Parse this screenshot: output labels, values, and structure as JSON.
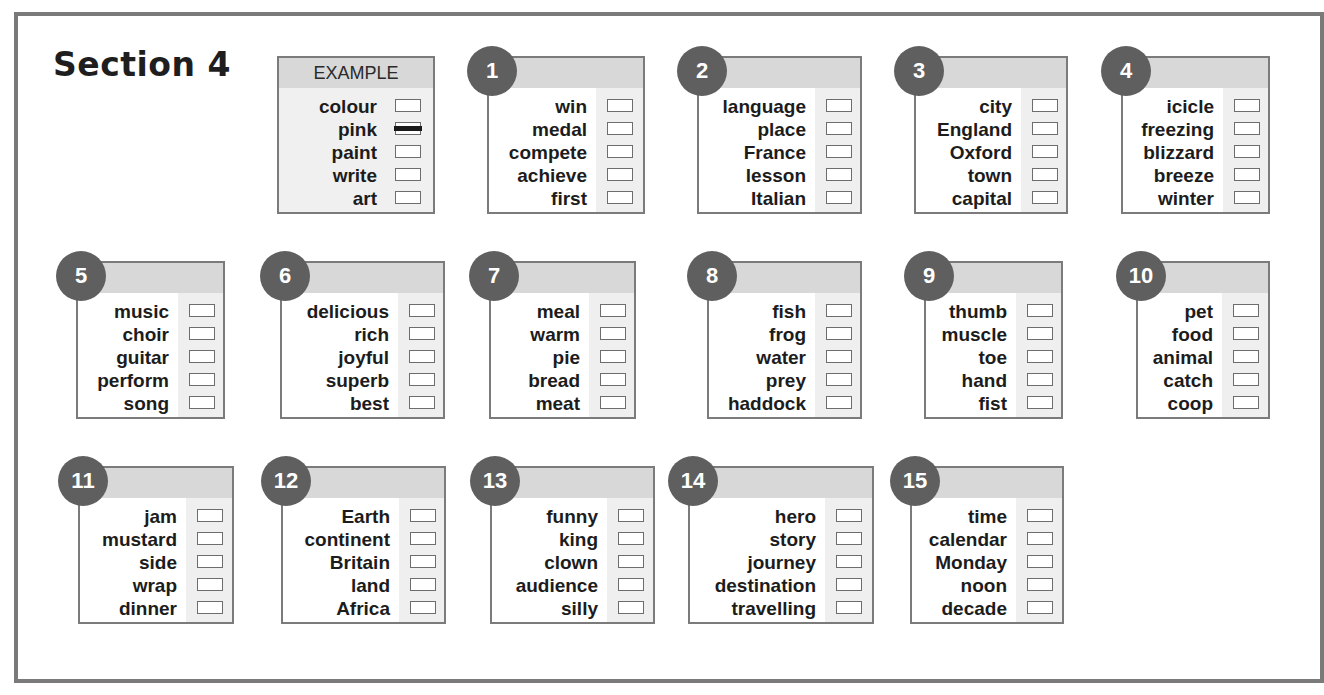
{
  "title": "Section 4",
  "colors": {
    "frame": "#7a7a7a",
    "badge": "#5f5f5f",
    "header": "#d8d8d8",
    "strip": "#efefef"
  },
  "example": {
    "label": "EXAMPLE",
    "words": [
      "colour",
      "pink",
      "paint",
      "write",
      "art"
    ],
    "marked_index": 1
  },
  "questions": [
    {
      "number": "1",
      "words": [
        "win",
        "medal",
        "compete",
        "achieve",
        "first"
      ]
    },
    {
      "number": "2",
      "words": [
        "language",
        "place",
        "France",
        "lesson",
        "Italian"
      ]
    },
    {
      "number": "3",
      "words": [
        "city",
        "England",
        "Oxford",
        "town",
        "capital"
      ]
    },
    {
      "number": "4",
      "words": [
        "icicle",
        "freezing",
        "blizzard",
        "breeze",
        "winter"
      ]
    },
    {
      "number": "5",
      "words": [
        "music",
        "choir",
        "guitar",
        "perform",
        "song"
      ]
    },
    {
      "number": "6",
      "words": [
        "delicious",
        "rich",
        "joyful",
        "superb",
        "best"
      ]
    },
    {
      "number": "7",
      "words": [
        "meal",
        "warm",
        "pie",
        "bread",
        "meat"
      ]
    },
    {
      "number": "8",
      "words": [
        "fish",
        "frog",
        "water",
        "prey",
        "haddock"
      ]
    },
    {
      "number": "9",
      "words": [
        "thumb",
        "muscle",
        "toe",
        "hand",
        "fist"
      ]
    },
    {
      "number": "10",
      "words": [
        "pet",
        "food",
        "animal",
        "catch",
        "coop"
      ]
    },
    {
      "number": "11",
      "words": [
        "jam",
        "mustard",
        "side",
        "wrap",
        "dinner"
      ]
    },
    {
      "number": "12",
      "words": [
        "Earth",
        "continent",
        "Britain",
        "land",
        "Africa"
      ]
    },
    {
      "number": "13",
      "words": [
        "funny",
        "king",
        "clown",
        "audience",
        "silly"
      ]
    },
    {
      "number": "14",
      "words": [
        "hero",
        "story",
        "journey",
        "destination",
        "travelling"
      ]
    },
    {
      "number": "15",
      "words": [
        "time",
        "calendar",
        "Monday",
        "noon",
        "decade"
      ]
    }
  ]
}
